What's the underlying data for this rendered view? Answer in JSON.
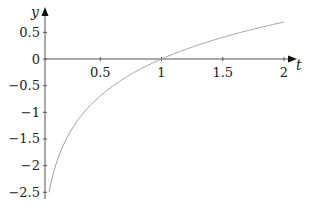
{
  "chart_data": {
    "type": "line",
    "title": "",
    "function": "y = ln(t)",
    "xlabel": "t",
    "ylabel": "y",
    "xlim": [
      0.05,
      2.1
    ],
    "ylim": [
      -2.55,
      0.75
    ],
    "x_ticks": [
      0.5,
      1,
      1.5,
      2
    ],
    "x_tick_labels": [
      "0.5",
      "1",
      "1.5",
      "2"
    ],
    "y_ticks": [
      0.5,
      0,
      -0.5,
      -1,
      -1.5,
      -2,
      -2.5
    ],
    "y_tick_labels": [
      "0.5",
      "0",
      "−0.5",
      "−1",
      "−1.5",
      "−2",
      "−2.5"
    ],
    "grid": false,
    "series": [
      {
        "name": "ln(t)",
        "color": "#a0a0a0",
        "x": [
          0.082,
          0.1,
          0.15,
          0.2,
          0.3,
          0.4,
          0.5,
          0.6,
          0.7,
          0.8,
          0.9,
          1.0,
          1.2,
          1.4,
          1.6,
          1.8,
          2.0
        ],
        "y": [
          -2.5,
          -2.303,
          -1.897,
          -1.609,
          -1.204,
          -0.916,
          -0.693,
          -0.511,
          -0.357,
          -0.223,
          -0.105,
          0.0,
          0.182,
          0.336,
          0.47,
          0.588,
          0.693
        ]
      }
    ],
    "axis_color": "#555555"
  }
}
